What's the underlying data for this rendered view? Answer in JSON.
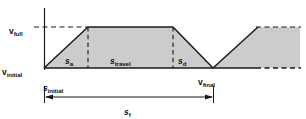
{
  "figure": {
    "kind": "velocity-profile-diagram",
    "background": "#ffffff",
    "fill_color": "#cccccc",
    "line_color": "#1a1a1a",
    "labels": {
      "v_full": {
        "base": "v",
        "sub": "full",
        "x": 9,
        "y": 21
      },
      "v_initial": {
        "base": "v",
        "sub": "initial",
        "x": 2,
        "y": 62
      },
      "v_final": {
        "base": "v",
        "sub": "final",
        "x": 198,
        "y": 72
      },
      "s_initial": {
        "base": "s",
        "sub": "initial",
        "x": 43,
        "y": 78
      },
      "s_a": {
        "base": "s",
        "sub": "a",
        "x": 65,
        "y": 51
      },
      "s_travel": {
        "base": "s",
        "sub": "travel",
        "x": 110,
        "y": 51
      },
      "s_d": {
        "base": "s",
        "sub": "d",
        "x": 178,
        "y": 51
      },
      "s_f": {
        "base": "s",
        "sub": "f",
        "x": 124,
        "y": 102
      }
    },
    "geometry": {
      "axis_x": 44,
      "axis_top_y": 8,
      "axis_bottom_y": 70,
      "baseline_y": 68,
      "vfull_y": 27,
      "accel_end_x": 88,
      "plateau_end_x": 173,
      "decel_end_x": 213,
      "ramp2_end_x": 258,
      "right_edge_x": 300,
      "dim_line_y": 97,
      "ext_top_y": 86,
      "ext_bottom_y": 102
    }
  }
}
